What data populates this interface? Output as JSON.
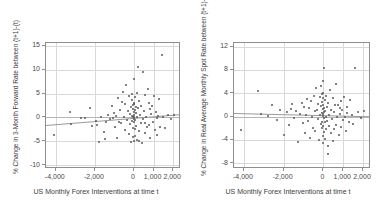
{
  "artifacts": {
    "top_clipped_text": "",
    "top_clipped_text_2": ""
  },
  "chart_data": [
    {
      "id": "left",
      "type": "scatter",
      "title": "",
      "xlabel": "US Monthly Forex Interventions at time t",
      "ylabel": "% Change in 3-Month Forward Rate between (t+1)-(t)",
      "xlim": [
        -4500,
        2400
      ],
      "ylim": [
        -10.8,
        15.6
      ],
      "xticks": [
        -4000,
        -2000,
        0,
        1000,
        2000
      ],
      "xticklabels": [
        "-4,000",
        "-2,000",
        "0",
        "1,000",
        "2,000"
      ],
      "yticks": [
        -10,
        -5,
        0,
        5,
        10,
        15
      ],
      "yticklabels": [
        "-10",
        "-5",
        "0",
        "5",
        "10",
        "15"
      ],
      "grid": true,
      "gridlines_v": [
        -4000,
        -2000,
        0,
        1000,
        2000
      ],
      "gridlines_h": [
        -10,
        -5,
        0,
        5,
        10,
        15
      ],
      "zero_reference_y": 0,
      "legend": "none",
      "fit_line": {
        "type": "linear",
        "x_start": -4500,
        "y_start": -1.55,
        "x_end": 2400,
        "y_end": 0.75
      },
      "points": [
        [
          -4100,
          -3.7
        ],
        [
          -3250,
          1.1
        ],
        [
          -3200,
          -1.3
        ],
        [
          -2500,
          -0.1
        ],
        [
          -2250,
          2.0
        ],
        [
          -2150,
          -1.8
        ],
        [
          -1950,
          -0.7
        ],
        [
          -1900,
          -1.6
        ],
        [
          -1800,
          -5.1
        ],
        [
          -1700,
          0.2
        ],
        [
          -1550,
          -3.1
        ],
        [
          -1500,
          -4.6
        ],
        [
          -1350,
          0.6
        ],
        [
          -1250,
          -0.4
        ],
        [
          -1150,
          2.4
        ],
        [
          -1100,
          -0.2
        ],
        [
          -1000,
          1.0
        ],
        [
          -950,
          -2.0
        ],
        [
          -900,
          0.4
        ],
        [
          -850,
          -4.3
        ],
        [
          -800,
          4.0
        ],
        [
          -750,
          -0.9
        ],
        [
          -700,
          1.6
        ],
        [
          -650,
          -1.1
        ],
        [
          -600,
          3.2
        ],
        [
          -560,
          5.4
        ],
        [
          -520,
          0.1
        ],
        [
          -480,
          -2.6
        ],
        [
          -440,
          2.8
        ],
        [
          -400,
          6.9
        ],
        [
          -360,
          -0.5
        ],
        [
          -320,
          1.3
        ],
        [
          -280,
          -3.4
        ],
        [
          -250,
          4.6
        ],
        [
          -220,
          0.8
        ],
        [
          -190,
          -1.4
        ],
        [
          -160,
          2.2
        ],
        [
          -140,
          -5.2
        ],
        [
          -120,
          3.6
        ],
        [
          -100,
          0.3
        ],
        [
          -90,
          -0.8
        ],
        [
          -80,
          5.0
        ],
        [
          -70,
          1.8
        ],
        [
          -60,
          -2.2
        ],
        [
          -50,
          0.0
        ],
        [
          -40,
          2.6
        ],
        [
          -30,
          -4.1
        ],
        [
          -20,
          1.2
        ],
        [
          -10,
          -0.3
        ],
        [
          0,
          0.5
        ],
        [
          0,
          8.0
        ],
        [
          0,
          -5.0
        ],
        [
          0,
          2.9
        ],
        [
          0,
          -1.0
        ],
        [
          10,
          0.2
        ],
        [
          20,
          3.1
        ],
        [
          30,
          -2.4
        ],
        [
          40,
          1.5
        ],
        [
          50,
          -0.6
        ],
        [
          60,
          4.3
        ],
        [
          70,
          -3.8
        ],
        [
          80,
          0.9
        ],
        [
          90,
          2.1
        ],
        [
          110,
          -1.7
        ],
        [
          130,
          5.1
        ],
        [
          150,
          0.0
        ],
        [
          170,
          -4.7
        ],
        [
          190,
          1.9
        ],
        [
          210,
          10.5
        ],
        [
          240,
          -2.9
        ],
        [
          270,
          3.4
        ],
        [
          300,
          0.6
        ],
        [
          330,
          -1.2
        ],
        [
          360,
          2.3
        ],
        [
          400,
          -5.3
        ],
        [
          440,
          9.6
        ],
        [
          470,
          -0.4
        ],
        [
          500,
          1.4
        ],
        [
          540,
          -3.3
        ],
        [
          580,
          4.8
        ],
        [
          620,
          0.1
        ],
        [
          660,
          -2.1
        ],
        [
          700,
          5.9
        ],
        [
          740,
          -1.5
        ],
        [
          780,
          3.0
        ],
        [
          820,
          -4.4
        ],
        [
          870,
          0.7
        ],
        [
          910,
          2.5
        ],
        [
          960,
          -0.9
        ],
        [
          1000,
          4.4
        ],
        [
          1050,
          -2.7
        ],
        [
          1100,
          1.1
        ],
        [
          1150,
          -3.6
        ],
        [
          1200,
          0.4
        ],
        [
          1280,
          3.8
        ],
        [
          1350,
          -1.9
        ],
        [
          1420,
          13.1
        ],
        [
          1500,
          0.2
        ],
        [
          1600,
          -2.3
        ],
        [
          1750,
          0.6
        ],
        [
          1900,
          -0.4
        ],
        [
          2050,
          0.5
        ],
        [
          -2700,
          -0.2
        ],
        [
          -1450,
          -1.0
        ],
        [
          250,
          -4.9
        ],
        [
          560,
          -1.1
        ],
        [
          840,
          1.7
        ],
        [
          1180,
          -0.2
        ]
      ]
    },
    {
      "id": "right",
      "type": "scatter",
      "title": "",
      "xlabel": "US Monthly Forex Interventions at time t",
      "ylabel": "% Change in Real Average Monthly Spot Rate between (t+1)-(t)",
      "xlim": [
        -4500,
        2400
      ],
      "ylim": [
        -9.0,
        12.6
      ],
      "xticks": [
        -4000,
        -2000,
        0,
        1000,
        2000
      ],
      "xticklabels": [
        "-4,000",
        "-2,000",
        "0",
        "1,000",
        "2,000"
      ],
      "yticks": [
        -8,
        -4,
        0,
        4,
        8,
        12
      ],
      "yticklabels": [
        "-8",
        "-4",
        "0",
        "4",
        "8",
        "12"
      ],
      "grid": true,
      "gridlines_v": [
        -4000,
        -2000,
        0,
        1000,
        2000
      ],
      "gridlines_h": [
        -8,
        -4,
        0,
        4,
        8,
        12
      ],
      "zero_reference_y": 0,
      "legend": "none",
      "fit_line": {
        "type": "linear",
        "x_start": -4500,
        "y_start": 0.62,
        "x_end": 2400,
        "y_end": 0.05
      },
      "points": [
        [
          -4150,
          -2.3
        ],
        [
          -3300,
          4.3
        ],
        [
          -3150,
          0.4
        ],
        [
          -2600,
          1.9
        ],
        [
          -2350,
          -0.6
        ],
        [
          -2200,
          1.2
        ],
        [
          -2000,
          -3.1
        ],
        [
          -1850,
          0.8
        ],
        [
          -1750,
          -1.5
        ],
        [
          -1600,
          2.1
        ],
        [
          -1500,
          -0.3
        ],
        [
          -1400,
          1.0
        ],
        [
          -1300,
          -4.4
        ],
        [
          -1200,
          0.5
        ],
        [
          -1100,
          2.4
        ],
        [
          -1000,
          -1.1
        ],
        [
          -950,
          1.6
        ],
        [
          -900,
          -2.8
        ],
        [
          -850,
          0.2
        ],
        [
          -800,
          3.0
        ],
        [
          -750,
          -0.8
        ],
        [
          -700,
          1.4
        ],
        [
          -650,
          -3.7
        ],
        [
          -600,
          2.7
        ],
        [
          -560,
          0.0
        ],
        [
          -520,
          -1.9
        ],
        [
          -480,
          3.6
        ],
        [
          -440,
          0.9
        ],
        [
          -400,
          -2.4
        ],
        [
          -360,
          4.9
        ],
        [
          -320,
          1.1
        ],
        [
          -280,
          -0.5
        ],
        [
          -250,
          2.2
        ],
        [
          -220,
          -4.0
        ],
        [
          -190,
          3.3
        ],
        [
          -160,
          0.3
        ],
        [
          -140,
          -1.3
        ],
        [
          -120,
          5.2
        ],
        [
          -100,
          1.8
        ],
        [
          -90,
          -2.0
        ],
        [
          -80,
          0.6
        ],
        [
          -70,
          3.9
        ],
        [
          -60,
          -0.9
        ],
        [
          -50,
          2.5
        ],
        [
          -40,
          -3.4
        ],
        [
          -30,
          1.3
        ],
        [
          -20,
          0.1
        ],
        [
          -10,
          4.1
        ],
        [
          0,
          -1.7
        ],
        [
          0,
          2.0
        ],
        [
          0,
          0.4
        ],
        [
          0,
          -4.6
        ],
        [
          0,
          6.1
        ],
        [
          0,
          3.2
        ],
        [
          10,
          -0.2
        ],
        [
          20,
          1.5
        ],
        [
          30,
          -2.6
        ],
        [
          40,
          8.4
        ],
        [
          50,
          0.7
        ],
        [
          60,
          -1.0
        ],
        [
          70,
          2.8
        ],
        [
          80,
          -3.9
        ],
        [
          90,
          1.0
        ],
        [
          110,
          0.0
        ],
        [
          130,
          -2.2
        ],
        [
          150,
          3.5
        ],
        [
          170,
          -0.7
        ],
        [
          190,
          1.7
        ],
        [
          210,
          -5.1
        ],
        [
          240,
          2.3
        ],
        [
          270,
          0.2
        ],
        [
          300,
          -1.6
        ],
        [
          330,
          4.6
        ],
        [
          360,
          -2.9
        ],
        [
          400,
          1.1
        ],
        [
          440,
          -0.4
        ],
        [
          470,
          3.1
        ],
        [
          500,
          -4.2
        ],
        [
          540,
          0.8
        ],
        [
          580,
          2.0
        ],
        [
          620,
          -1.4
        ],
        [
          660,
          5.5
        ],
        [
          700,
          -0.1
        ],
        [
          740,
          1.9
        ],
        [
          780,
          -3.2
        ],
        [
          820,
          0.5
        ],
        [
          870,
          2.6
        ],
        [
          910,
          -1.8
        ],
        [
          960,
          1.2
        ],
        [
          1000,
          -0.6
        ],
        [
          1050,
          3.4
        ],
        [
          1100,
          0.0
        ],
        [
          1150,
          -2.5
        ],
        [
          1200,
          1.6
        ],
        [
          1280,
          -0.9
        ],
        [
          1350,
          2.9
        ],
        [
          1420,
          0.3
        ],
        [
          1500,
          -1.2
        ],
        [
          1600,
          8.3
        ],
        [
          1750,
          0.7
        ],
        [
          1900,
          -0.3
        ],
        [
          2050,
          0.9
        ],
        [
          -2800,
          0.1
        ],
        [
          -1650,
          1.3
        ],
        [
          250,
          -6.4
        ],
        [
          560,
          -2.1
        ],
        [
          840,
          1.4
        ],
        [
          1180,
          0.6
        ]
      ]
    }
  ]
}
